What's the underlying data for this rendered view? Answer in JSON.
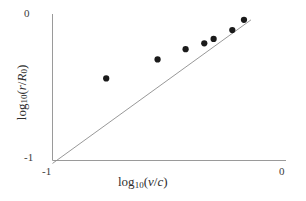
{
  "figure": {
    "background_color": "#ffffff",
    "axis_color": "#9a9a9a",
    "marker_color": "#1a1a1a",
    "trendline_color": "#8c8c8c"
  },
  "axes": {
    "x": {
      "title_prefix": "log",
      "title_sub": "10",
      "title_open": "(",
      "title_num": "v",
      "title_slash": "/",
      "title_den": "c",
      "title_close": ")",
      "tick_min_label": "-1",
      "tick_max_label": "0"
    },
    "y": {
      "title_prefix": "log",
      "title_sub": "10",
      "title_open": "(",
      "title_num": "r",
      "title_slash": "/",
      "title_den": "R",
      "title_den_sub": "0",
      "title_close": ")",
      "tick_min_label": "-1",
      "tick_max_label": "0"
    }
  },
  "chart_data": {
    "type": "scatter",
    "title": "",
    "xlabel": "log10(v/c)",
    "ylabel": "log10(r/R0)",
    "xlim": [
      -1,
      0
    ],
    "ylim": [
      -1,
      0
    ],
    "grid": false,
    "legend": "none",
    "xticks": [
      -1,
      0
    ],
    "yticks": [
      -1,
      0
    ],
    "xticklabels": [
      "-1",
      "0"
    ],
    "yticklabels": [
      "-1",
      "0"
    ],
    "series": [
      {
        "name": "measurements",
        "marker": "filled-circle",
        "marker_color": "#1a1a1a",
        "marker_size": 4,
        "x": [
          -0.77,
          -0.55,
          -0.43,
          -0.35,
          -0.31,
          -0.23,
          -0.18
        ],
        "y": [
          -0.44,
          -0.31,
          -0.24,
          -0.2,
          -0.17,
          -0.11,
          -0.04
        ]
      },
      {
        "name": "fit-line",
        "type": "line",
        "line_color": "#8c8c8c",
        "slope": 1.15,
        "intercept": 0.13,
        "x": [
          -1.0,
          -0.15
        ],
        "y": [
          -1.02,
          -0.04
        ]
      }
    ]
  }
}
